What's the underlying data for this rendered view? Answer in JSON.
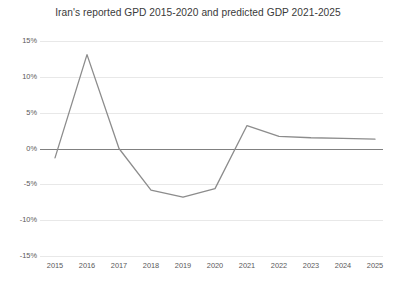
{
  "chart_data": {
    "type": "line",
    "title": "Iran's reported GPD 2015-2020 and predicted GDP 2021-2025",
    "xlabel": "",
    "ylabel": "",
    "categories": [
      "2015",
      "2016",
      "2017",
      "2018",
      "2019",
      "2020",
      "2021",
      "2022",
      "2023",
      "2024",
      "2025"
    ],
    "values": [
      -1.3,
      13.1,
      0.0,
      -5.8,
      -6.8,
      -5.6,
      3.2,
      1.7,
      1.5,
      1.4,
      1.3
    ],
    "series": [
      {
        "name": "GDP growth",
        "values": [
          -1.3,
          13.1,
          0.0,
          -5.8,
          -6.8,
          -5.6,
          3.2,
          1.7,
          1.5,
          1.4,
          1.3
        ]
      }
    ],
    "ylim": [
      -15,
      15
    ],
    "yticks": [
      15,
      10,
      5,
      0,
      -5,
      -10,
      -15
    ],
    "ytick_labels": [
      "15%",
      "10%",
      "5%",
      "0%",
      "-5%",
      "-10%",
      "-15%"
    ],
    "xtick_labels": [
      "2015",
      "2016",
      "2017",
      "2018",
      "2019",
      "2020",
      "2021",
      "2022",
      "2023",
      "2024",
      "2025"
    ],
    "grid": true,
    "legend": false,
    "legend_position": "none",
    "line_color": "#8c8c8c",
    "zero_line_color": "#808080",
    "gridline_color": "#e8e8e8",
    "background_color": "#ffffff",
    "annotations": []
  }
}
